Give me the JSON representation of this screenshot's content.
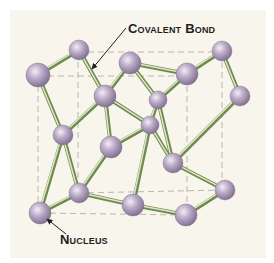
{
  "labels": {
    "covalent_bond": "Covalent Bond",
    "nucleus": "Nucleus"
  },
  "colors": {
    "background": "#ffffff",
    "panel": "#f7f5ec",
    "atom_fill": "#b9a8c6",
    "atom_highlight": "#f3eef6",
    "atom_shadow": "#7c6b8a",
    "bond_dark": "#6f8a4a",
    "bond_light": "#dfe6cf",
    "dashed_line": "#b8b8b0",
    "text": "#1e1e1e"
  },
  "atoms": [
    {
      "id": "A",
      "x": 79,
      "y": 50,
      "r": 10
    },
    {
      "id": "B",
      "x": 38,
      "y": 75,
      "r": 12
    },
    {
      "id": "C",
      "x": 130,
      "y": 63,
      "r": 11
    },
    {
      "id": "D",
      "x": 222,
      "y": 51,
      "r": 10
    },
    {
      "id": "E",
      "x": 187,
      "y": 74,
      "r": 11
    },
    {
      "id": "F",
      "x": 105,
      "y": 96,
      "r": 11
    },
    {
      "id": "G",
      "x": 158,
      "y": 100,
      "r": 9
    },
    {
      "id": "H",
      "x": 240,
      "y": 96,
      "r": 10
    },
    {
      "id": "I",
      "x": 150,
      "y": 125,
      "r": 9
    },
    {
      "id": "J",
      "x": 63,
      "y": 135,
      "r": 10
    },
    {
      "id": "K",
      "x": 111,
      "y": 147,
      "r": 11
    },
    {
      "id": "L",
      "x": 173,
      "y": 163,
      "r": 10
    },
    {
      "id": "M",
      "x": 79,
      "y": 193,
      "r": 10
    },
    {
      "id": "N",
      "x": 133,
      "y": 205,
      "r": 11
    },
    {
      "id": "O",
      "x": 225,
      "y": 190,
      "r": 10
    },
    {
      "id": "P",
      "x": 40,
      "y": 213,
      "r": 11
    },
    {
      "id": "Q",
      "x": 186,
      "y": 215,
      "r": 11
    }
  ],
  "bonds": [
    [
      "A",
      "B"
    ],
    [
      "A",
      "F"
    ],
    [
      "B",
      "J"
    ],
    [
      "C",
      "E"
    ],
    [
      "C",
      "G"
    ],
    [
      "C",
      "F"
    ],
    [
      "D",
      "E"
    ],
    [
      "D",
      "H"
    ],
    [
      "F",
      "I"
    ],
    [
      "F",
      "K"
    ],
    [
      "G",
      "E"
    ],
    [
      "G",
      "L"
    ],
    [
      "G",
      "I"
    ],
    [
      "H",
      "L"
    ],
    [
      "I",
      "K"
    ],
    [
      "I",
      "L"
    ],
    [
      "K",
      "M"
    ],
    [
      "J",
      "M"
    ],
    [
      "J",
      "P"
    ],
    [
      "M",
      "P"
    ],
    [
      "M",
      "N"
    ],
    [
      "N",
      "I"
    ],
    [
      "N",
      "Q"
    ],
    [
      "L",
      "O"
    ],
    [
      "O",
      "Q"
    ],
    [
      "J",
      "F"
    ]
  ],
  "dashed_lines": [
    [
      [
        78,
        52
      ],
      [
        222,
        52
      ]
    ],
    [
      [
        38,
        76
      ],
      [
        187,
        76
      ]
    ],
    [
      [
        38,
        76
      ],
      [
        38,
        213
      ]
    ],
    [
      [
        78,
        52
      ],
      [
        78,
        193
      ]
    ],
    [
      [
        222,
        52
      ],
      [
        222,
        190
      ]
    ],
    [
      [
        187,
        76
      ],
      [
        187,
        215
      ]
    ],
    [
      [
        78,
        193
      ],
      [
        225,
        190
      ]
    ],
    [
      [
        40,
        213
      ],
      [
        186,
        215
      ]
    ]
  ],
  "annotations": [
    {
      "name": "covalent-bond-arrow",
      "from": [
        126,
        28
      ],
      "to": [
        92,
        69
      ]
    },
    {
      "name": "nucleus-arrow",
      "from": [
        66,
        234
      ],
      "to": [
        47,
        219
      ]
    }
  ]
}
